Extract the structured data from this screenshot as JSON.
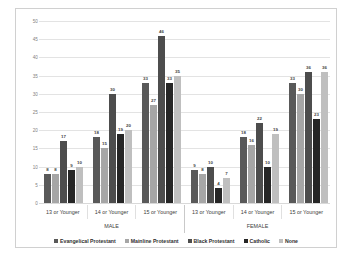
{
  "chart_data": {
    "type": "bar",
    "title": "",
    "xlabel": "",
    "ylabel": "",
    "ylim": [
      0,
      50
    ],
    "yticks": [
      0,
      5,
      10,
      15,
      20,
      25,
      30,
      35,
      40,
      45,
      50
    ],
    "grid": true,
    "legend_position": "bottom",
    "data_labels": true,
    "supercategories": [
      "MALE",
      "FEMALE"
    ],
    "categories": [
      "13 or Younger",
      "14 or Younger",
      "15 or Younger",
      "13 or Younger",
      "14 or Younger",
      "15 or Younger"
    ],
    "series": [
      {
        "name": "Evangelical Protestant",
        "color": "#595959",
        "values": [
          8,
          18,
          33,
          9,
          18,
          33
        ]
      },
      {
        "name": "Mainline Protestant",
        "color": "#a6a6a6",
        "values": [
          8,
          15,
          27,
          8,
          16,
          30
        ]
      },
      {
        "name": "Black Protestant",
        "color": "#4d4d4d",
        "values": [
          17,
          30,
          46,
          10,
          22,
          36
        ]
      },
      {
        "name": "Catholic",
        "color": "#262626",
        "values": [
          9,
          19,
          33,
          4,
          10,
          23
        ]
      },
      {
        "name": "None",
        "color": "#bfbfbf",
        "values": [
          10,
          20,
          35,
          7,
          19,
          36
        ]
      }
    ]
  },
  "legend": {
    "items": [
      {
        "label": "Evangelical Protestant"
      },
      {
        "label": "Mainline Protestant"
      },
      {
        "label": "Black Protestant"
      },
      {
        "label": "Catholic"
      },
      {
        "label": "None"
      }
    ]
  }
}
